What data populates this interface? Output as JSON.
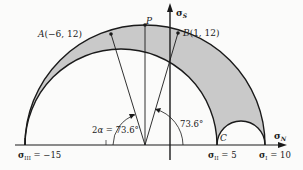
{
  "diagram": {
    "type": "mohr_circle_3d",
    "axes": {
      "horizontal_label": "σ",
      "horizontal_sub": "N",
      "vertical_label": "σ",
      "vertical_sub": "S"
    },
    "principal_stresses": [
      {
        "label": "σ",
        "sub": "III",
        "text": " = −15",
        "value": -15
      },
      {
        "label": "σ",
        "sub": "II",
        "text": " = 5",
        "value": 5
      },
      {
        "label": "σ",
        "sub": "I",
        "text": " = 10",
        "value": 10
      }
    ],
    "points": {
      "A": {
        "name": "A",
        "coords": "(−6, 12)",
        "x": -6,
        "y": 12
      },
      "B": {
        "name": "B",
        "coords": "(1, 12)",
        "x": 1,
        "y": 12
      },
      "P": {
        "name": "P"
      },
      "C": {
        "name": "C"
      }
    },
    "angles": {
      "left": "2α = 73.6°",
      "left_prefix": "2",
      "left_alpha": "α",
      "left_value": " = 73.6°",
      "right": "73.6°"
    },
    "colors": {
      "shade": "#c9c9c9",
      "line": "#1a1a1a",
      "background": "#fbfbfa"
    }
  }
}
